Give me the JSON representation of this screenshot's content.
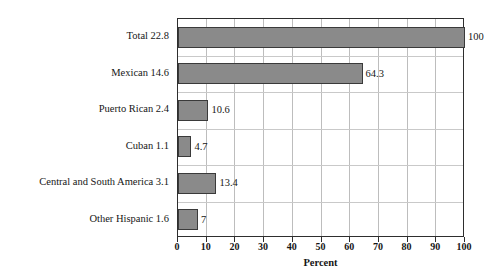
{
  "chart_data": {
    "type": "bar",
    "orientation": "horizontal",
    "title": "",
    "xlabel": "Percent",
    "ylabel": "",
    "xlim": [
      0,
      100
    ],
    "xticks": [
      0,
      10,
      20,
      30,
      40,
      50,
      60,
      70,
      80,
      90,
      100
    ],
    "xtick_labels": [
      "0",
      "10",
      "20",
      "30",
      "40",
      "50",
      "60",
      "70",
      "80",
      "90",
      "100"
    ],
    "grid": true,
    "legend": false,
    "categories": [
      "Total 22.8",
      "Mexican 14.6",
      "Puerto Rican 2.4",
      "Cuban 1.1",
      "Central and South America 3.1",
      "Other Hispanic 1.6"
    ],
    "values": [
      100,
      64.3,
      10.6,
      4.7,
      13.4,
      7
    ],
    "value_labels": [
      "100",
      "64.3",
      "10.6",
      "4.7",
      "13.4",
      "7"
    ],
    "bar_color": "#8a8a8a",
    "bar_edge_color": "#3a3a3a",
    "grid_color": "#bdbdbd",
    "axis_color": "#2e2e2e"
  },
  "bars": [
    {
      "category": "Total 22.8",
      "value": 100,
      "value_label": "100"
    },
    {
      "category": "Mexican 14.6",
      "value": 64.3,
      "value_label": "64.3"
    },
    {
      "category": "Puerto Rican 2.4",
      "value": 10.6,
      "value_label": "10.6"
    },
    {
      "category": "Cuban 1.1",
      "value": 4.7,
      "value_label": "4.7"
    },
    {
      "category": "Central and South America 3.1",
      "value": 13.4,
      "value_label": "13.4"
    },
    {
      "category": "Other Hispanic 1.6",
      "value": 7,
      "value_label": "7"
    }
  ],
  "axis": {
    "x_title": "Percent",
    "x_ticks": [
      "0",
      "10",
      "20",
      "30",
      "40",
      "50",
      "60",
      "70",
      "80",
      "90",
      "100"
    ]
  }
}
